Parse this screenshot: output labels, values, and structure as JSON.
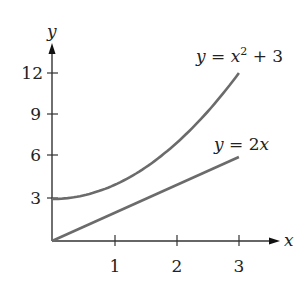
{
  "chart_data": {
    "type": "line",
    "title": "",
    "xlabel": "x",
    "ylabel": "y",
    "xlim": [
      0,
      3
    ],
    "ylim": [
      0,
      12
    ],
    "x_ticks": [
      "1",
      "2",
      "3"
    ],
    "y_ticks": [
      "3",
      "6",
      "9",
      "12"
    ],
    "grid": false,
    "legend": "inline annotations",
    "series": [
      {
        "name": "y = x^2 + 3",
        "label_parts": {
          "lhs": "y",
          "eq": " = ",
          "var": "x",
          "sup": "2",
          "rest": " + 3"
        },
        "x": [
          0,
          0.5,
          1,
          1.5,
          2,
          2.5,
          3
        ],
        "values": [
          3,
          3.25,
          4,
          5.25,
          7,
          9.25,
          12
        ],
        "color": "#6b6b6b"
      },
      {
        "name": "y = 2x",
        "label_parts": {
          "lhs": "y",
          "eq": " = 2",
          "var": "x"
        },
        "x": [
          0,
          3
        ],
        "values": [
          0,
          6
        ],
        "color": "#6b6b6b"
      }
    ]
  }
}
